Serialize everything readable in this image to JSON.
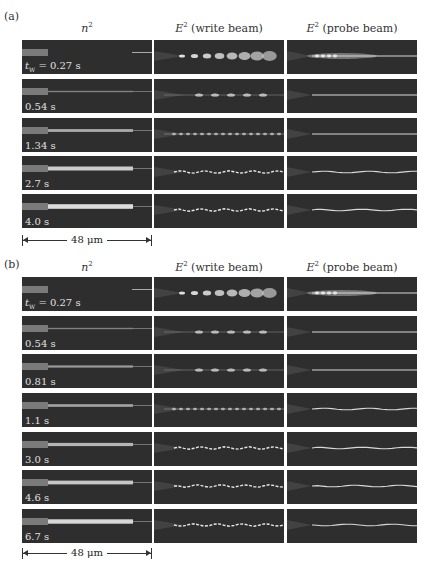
{
  "figure": {
    "panels": [
      {
        "id": "a",
        "label": "(a)",
        "columns": [
          {
            "prefix": "E",
            "sup": "2",
            "title": "n²",
            "kind": "n2"
          },
          {
            "title": "E² (write beam)",
            "kind": "write"
          },
          {
            "title": "E² (probe beam)",
            "kind": "probe"
          }
        ],
        "column_titles": {
          "n2_base": "n",
          "n2_sup": "2",
          "write_base": "E",
          "write_sup": "2",
          "write_rest": " (write beam)",
          "probe_base": "E",
          "probe_sup": "2",
          "probe_rest": " (probe beam)"
        },
        "rows": [
          {
            "time_prefix": "t",
            "time_sub": "W",
            "time_text": " = 0.27 s",
            "n2_fill": 0.0,
            "write_pattern": "spots"
          },
          {
            "time_text": "0.54 s",
            "n2_fill": 0.1,
            "write_pattern": "sparse"
          },
          {
            "time_text": "1.34 s",
            "n2_fill": 0.45,
            "write_pattern": "dense"
          },
          {
            "time_text": "2.7 s",
            "n2_fill": 0.75,
            "write_pattern": "filament"
          },
          {
            "time_text": "4.0 s",
            "n2_fill": 0.9,
            "write_pattern": "filament"
          }
        ],
        "scale_bar": "48 μm"
      },
      {
        "id": "b",
        "label": "(b)",
        "column_titles": {
          "n2_base": "n",
          "n2_sup": "2",
          "write_base": "E",
          "write_sup": "2",
          "write_rest": " (write beam)",
          "probe_base": "E",
          "probe_sup": "2",
          "probe_rest": " (probe beam)"
        },
        "rows": [
          {
            "time_prefix": "t",
            "time_sub": "W",
            "time_text": " = 0.27 s",
            "n2_fill": 0.0,
            "write_pattern": "spots"
          },
          {
            "time_text": "0.54 s",
            "n2_fill": 0.1,
            "write_pattern": "sparse"
          },
          {
            "time_text": "0.81 s",
            "n2_fill": 0.3,
            "write_pattern": "sparse"
          },
          {
            "time_text": "1.1 s",
            "n2_fill": 0.4,
            "write_pattern": "dense"
          },
          {
            "time_text": "3.0 s",
            "n2_fill": 0.55,
            "write_pattern": "filament"
          },
          {
            "time_text": "4.6 s",
            "n2_fill": 0.7,
            "write_pattern": "filament"
          },
          {
            "time_text": "6.7 s",
            "n2_fill": 0.85,
            "write_pattern": "filament"
          }
        ],
        "scale_bar": "48 μm"
      }
    ]
  }
}
